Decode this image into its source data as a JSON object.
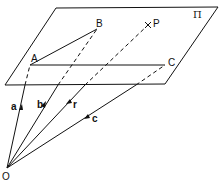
{
  "diagram": {
    "plane_label": "Π",
    "points": {
      "A": "A",
      "B": "B",
      "C": "C",
      "P": "P",
      "O": "O"
    },
    "vectors": {
      "a": "a",
      "b": "b",
      "r": "r",
      "c": "c"
    }
  }
}
